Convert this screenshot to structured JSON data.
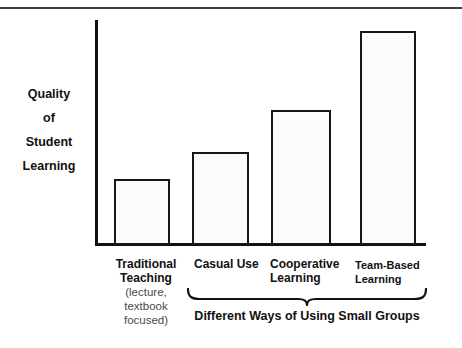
{
  "chart_data": {
    "type": "bar",
    "title": "",
    "xlabel": "Different Ways of Using Small Groups",
    "ylabel": "Quality of Student Learning",
    "categories": [
      "Traditional Teaching",
      "Casual Use",
      "Cooperative Learning",
      "Team-Based Learning"
    ],
    "category_sublabels": [
      "(lecture, textbook focused)",
      "",
      "",
      ""
    ],
    "values": [
      30,
      42,
      61,
      97
    ],
    "ylim": [
      0,
      100
    ],
    "grid": false,
    "legend": false,
    "bar_fill": "#fbfbfb",
    "bar_outline": "#161616",
    "annotation": "Brace spans Casual Use, Cooperative Learning and Team-Based Learning"
  },
  "axis": {
    "y_label_lines": [
      "Quality",
      "of",
      "Student",
      "Learning"
    ]
  },
  "bars": [
    {
      "label": "Traditional Teaching",
      "sublabel": "(lecture, textbook focused)",
      "value": 30
    },
    {
      "label": "Casual Use",
      "sublabel": "",
      "value": 42
    },
    {
      "label": "Cooperative Learning",
      "sublabel": "",
      "value": 61
    },
    {
      "label": "Team-Based Learning",
      "sublabel": "",
      "value": 97
    }
  ],
  "group": {
    "caption": "Different Ways of Using Small Groups"
  },
  "categories_display": {
    "c0_main": "Traditional Teaching",
    "c0_sub": "(lecture, textbook focused)",
    "c1": "Casual Use",
    "c2": "Cooperative Learning",
    "c3": "Team-Based Learning"
  }
}
